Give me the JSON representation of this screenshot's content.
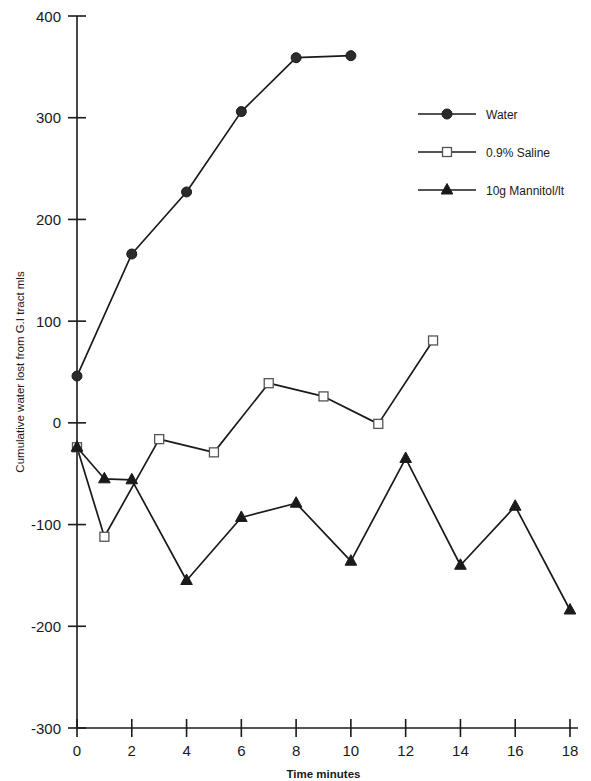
{
  "chart_data": {
    "type": "line",
    "title": "",
    "xlabel": "Time minutes",
    "ylabel": "Cumulative water lost from G.I tract  mls",
    "xlim": [
      0,
      18
    ],
    "ylim": [
      -300,
      400
    ],
    "xticks": [
      0,
      2,
      4,
      6,
      8,
      10,
      12,
      14,
      16,
      18
    ],
    "yticks": [
      400,
      300,
      200,
      100,
      0,
      -100,
      -200,
      -300
    ],
    "xtick_labels": [
      "0",
      "2",
      "4",
      "6",
      "8",
      "10",
      "12",
      "14",
      "16",
      "18"
    ],
    "ytick_labels": [
      "400",
      "300",
      "200",
      "100",
      "0",
      "-100",
      "-200",
      "-300"
    ],
    "grid": false,
    "legend_position": "top-right",
    "series": [
      {
        "name": "Water",
        "marker": "filled-circle",
        "color": "#1a1a1a",
        "x": [
          0,
          2,
          4,
          6,
          8,
          10
        ],
        "values": [
          46,
          166,
          227,
          306,
          359,
          361
        ]
      },
      {
        "name": "0.9% Saline",
        "marker": "open-square",
        "color": "#1a1a1a",
        "x": [
          0,
          1,
          3,
          5,
          7,
          9,
          11,
          13
        ],
        "values": [
          -24,
          -112,
          -16,
          -29,
          39,
          26,
          -1,
          81
        ]
      },
      {
        "name": "10g Mannitol/lt",
        "marker": "filled-triangle",
        "color": "#1a1a1a",
        "x": [
          0,
          1,
          2,
          4,
          6,
          8,
          10,
          12,
          14,
          16,
          18
        ],
        "values": [
          -24,
          -55,
          -56,
          -155,
          -93,
          -79,
          -136,
          -35,
          -140,
          -82,
          -184
        ]
      }
    ]
  },
  "legend": {
    "items": [
      {
        "label": "Water",
        "marker": "filled-circle"
      },
      {
        "label": "0.9% Saline",
        "marker": "open-square"
      },
      {
        "label": "10g Mannitol/lt",
        "marker": "filled-triangle"
      }
    ]
  },
  "axes": {
    "x_title": "Time minutes",
    "y_title": "Cumulative water lost from G.I tract  mls"
  }
}
